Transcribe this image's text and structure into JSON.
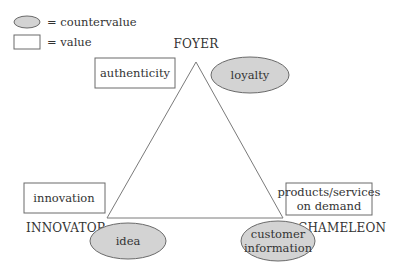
{
  "legend": {
    "countervalue_label": "= countervalue",
    "value_label": "= value"
  },
  "vertices": {
    "top": "FOYER",
    "left": "INNOVATOR",
    "right": "CHAMELEON"
  },
  "values": {
    "foyer": "authenticity",
    "innovator": "innovation",
    "chameleon_line1": "products/services",
    "chameleon_line2": "on demand"
  },
  "countervalues": {
    "foyer": "loyalty",
    "innovator": "idea",
    "chameleon_line1": "customer",
    "chameleon_line2": "information"
  },
  "colors": {
    "countervalue_fill": "#d3d3d3",
    "outline": "#6a6a6a",
    "text": "#333333"
  }
}
